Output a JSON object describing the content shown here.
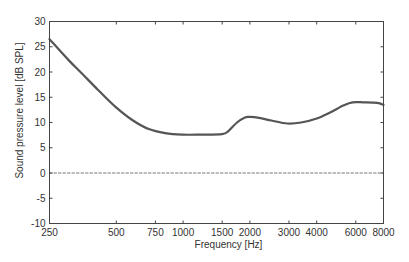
{
  "chart_data": {
    "type": "line",
    "title": "",
    "xlabel": "Frequency [Hz]",
    "ylabel": "Sound pressure level [dB SPL]",
    "xscale": "log",
    "xlim": [
      250,
      8000
    ],
    "ylim": [
      -10,
      30
    ],
    "x_ticks": [
      250,
      500,
      750,
      1000,
      1500,
      2000,
      3000,
      4000,
      6000,
      8000
    ],
    "x_tick_labels": [
      "250",
      "500",
      "750",
      "1000",
      "1500",
      "2000",
      "3000",
      "4000",
      "6000",
      "8000"
    ],
    "y_ticks": [
      -10,
      -5,
      0,
      5,
      10,
      15,
      20,
      25,
      30
    ],
    "y_tick_labels": [
      "-10",
      "-5",
      "0",
      "5",
      "10",
      "15",
      "20",
      "25",
      "30"
    ],
    "grid": false,
    "legend": null,
    "series": [
      {
        "name": "threshold curve",
        "color": "#555555",
        "style": "solid",
        "x": [
          250,
          304,
          350,
          415,
          496,
          590,
          700,
          830,
          990,
          1200,
          1500,
          1600,
          1750,
          1900,
          2000,
          2200,
          2500,
          2950,
          3400,
          4000,
          4600,
          5300,
          5800,
          6500,
          7500,
          8000
        ],
        "y": [
          26.5,
          22.4,
          19.7,
          16.4,
          13.1,
          10.5,
          8.7,
          7.9,
          7.6,
          7.6,
          7.7,
          8.3,
          10.0,
          11.0,
          11.1,
          10.9,
          10.4,
          9.8,
          10.0,
          10.8,
          12.0,
          13.4,
          14.0,
          14.0,
          13.9,
          13.5
        ]
      },
      {
        "name": "reference 0 dB",
        "color": "#555555",
        "style": "dashed",
        "x": [
          250,
          8000
        ],
        "y": [
          0,
          0
        ]
      }
    ]
  }
}
